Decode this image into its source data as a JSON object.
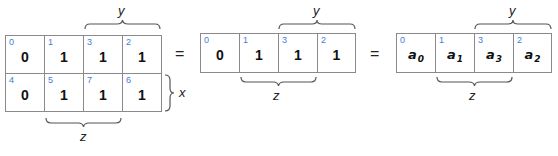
{
  "left_kmap": {
    "rows": [
      [
        {
          "index": "0",
          "value": "0"
        },
        {
          "index": "1",
          "value": "1"
        },
        {
          "index": "3",
          "value": "1"
        },
        {
          "index": "2",
          "value": "1"
        }
      ],
      [
        {
          "index": "4",
          "value": "0"
        },
        {
          "index": "5",
          "value": "1"
        },
        {
          "index": "7",
          "value": "1"
        },
        {
          "index": "6",
          "value": "1"
        }
      ]
    ],
    "labels": {
      "top": "y",
      "right": "x",
      "bottom": "z"
    }
  },
  "equals_1": "=",
  "middle_map": {
    "cells": [
      {
        "index": "0",
        "value": "0"
      },
      {
        "index": "1",
        "value": "1"
      },
      {
        "index": "3",
        "value": "1"
      },
      {
        "index": "2",
        "value": "1"
      }
    ],
    "labels": {
      "top": "y",
      "bottom": "z"
    }
  },
  "equals_2": "=",
  "right_map": {
    "cells": [
      {
        "index": "0",
        "var": "a",
        "sub": "0"
      },
      {
        "index": "1",
        "var": "a",
        "sub": "1"
      },
      {
        "index": "3",
        "var": "a",
        "sub": "3"
      },
      {
        "index": "2",
        "var": "a",
        "sub": "2"
      }
    ],
    "labels": {
      "top": "y",
      "bottom": "z"
    }
  },
  "colors": {
    "index": "#3b7dd8",
    "border": "#8a8a8a",
    "text": "#111111"
  }
}
